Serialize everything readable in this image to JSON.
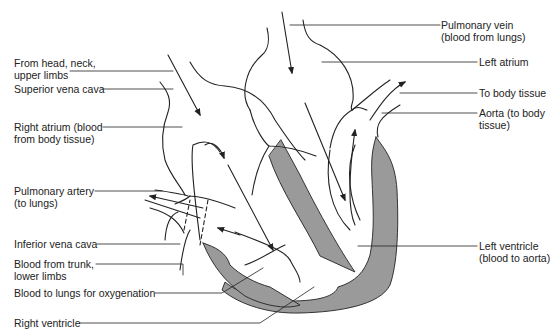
{
  "diagram": {
    "colors": {
      "line": "#222222",
      "muscle": "#9a9a9a",
      "background": "#ffffff"
    },
    "labels": {
      "from_head": {
        "line1": "From head, neck,",
        "line2": "upper limbs"
      },
      "superior_vena_cava": {
        "line1": "Superior vena cava"
      },
      "right_atrium": {
        "line1": "Right atrium (blood",
        "line2": "from body tissue)"
      },
      "pulmonary_artery": {
        "line1": "Pulmonary artery",
        "line2": "(to lungs)"
      },
      "inferior_vena_cava": {
        "line1": "Inferior vena cava"
      },
      "blood_from_trunk": {
        "line1": "Blood from trunk,",
        "line2": "lower limbs"
      },
      "blood_to_lungs": {
        "line1": "Blood to lungs for oxygenation"
      },
      "right_ventricle": {
        "line1": "Right ventricle"
      },
      "pulmonary_vein": {
        "line1": "Pulmonary vein",
        "line2": "(blood from lungs)"
      },
      "left_atrium": {
        "line1": "Left atrium"
      },
      "to_body_tissue": {
        "line1": "To body tissue"
      },
      "aorta": {
        "line1": "Aorta (to body",
        "line2": "tissue)"
      },
      "left_ventricle": {
        "line1": "Left ventricle",
        "line2": "(blood to aorta)"
      }
    }
  }
}
